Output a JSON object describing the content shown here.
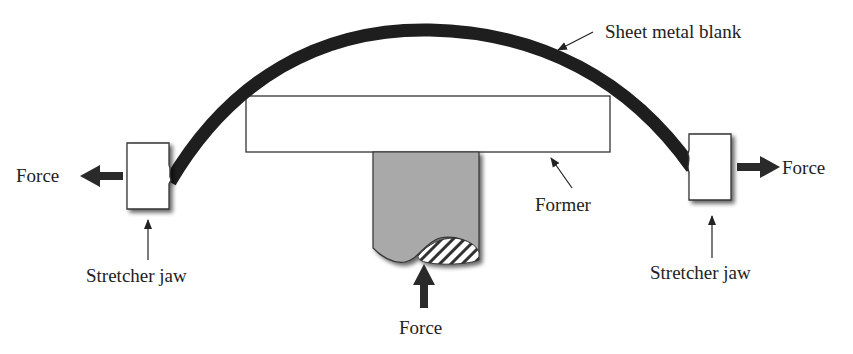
{
  "labels": {
    "sheet": "Sheet metal blank",
    "former": "Former",
    "force_left": "Force",
    "force_right": "Force",
    "force_bottom": "Force",
    "jaw_left": "Stretcher jaw",
    "jaw_right": "Stretcher jaw"
  },
  "colors": {
    "sheet": "#1e1e1e",
    "ram": "#a9a9a9",
    "outline": "#333333",
    "arrow": "#2a2a2a"
  }
}
